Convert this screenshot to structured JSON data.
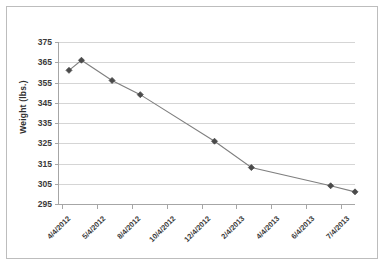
{
  "chart_data": {
    "type": "line",
    "title": "",
    "xlabel": "",
    "ylabel": "Weight (lbs.)",
    "ylim": [
      295,
      375
    ],
    "yticks": [
      295,
      305,
      315,
      325,
      335,
      345,
      355,
      365,
      375
    ],
    "grid": true,
    "legend": "none",
    "marker": "diamond",
    "line_color": "#7f7f7f",
    "marker_color": "#4a4a4a",
    "grid_color": "#d5d5d5",
    "axis_color": "#a6a6a6",
    "xtick_labels": [
      "4/4/2012",
      "5/4/2012",
      "8/4/2012",
      "10/4/2012",
      "12/4/2012",
      "2/4/2013",
      "4/4/2013",
      "6/4/2013",
      "7/4/2013"
    ],
    "points": [
      {
        "x": "4/4/2012",
        "y": 361
      },
      {
        "x": "5/8/2012",
        "y": 366
      },
      {
        "x": "6/20/2012",
        "y": 356
      },
      {
        "x": "8/1/2012",
        "y": 349
      },
      {
        "x": "11/25/2012",
        "y": 326
      },
      {
        "x": "1/20/2013",
        "y": 313
      },
      {
        "x": "5/25/2013",
        "y": 304
      },
      {
        "x": "7/4/2013",
        "y": 301
      }
    ],
    "values": [
      361,
      366,
      356,
      349,
      326,
      313,
      304,
      301
    ]
  }
}
